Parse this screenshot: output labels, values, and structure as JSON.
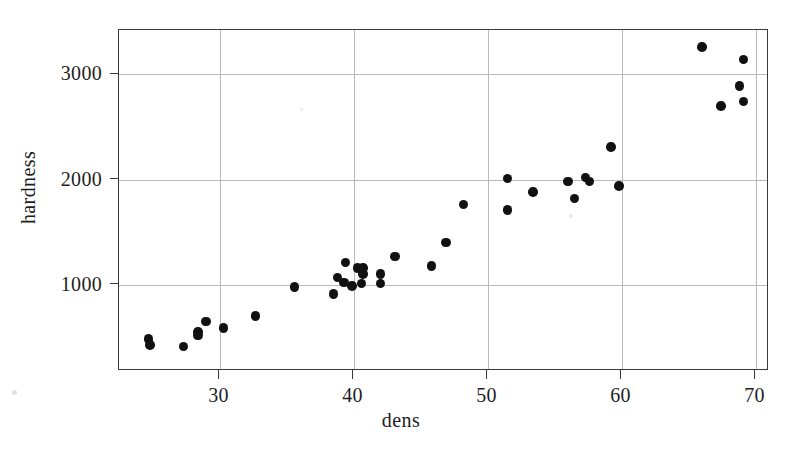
{
  "chart_data": {
    "type": "scatter",
    "title": "",
    "xlabel": "dens",
    "ylabel": "hardness",
    "xlim": [
      22.5,
      71.0
    ],
    "ylim": [
      180,
      3420
    ],
    "grid": true,
    "legend": "none",
    "marker": "filled-circle",
    "marker_color": "#111111",
    "xticks": [
      30,
      40,
      50,
      60,
      70
    ],
    "xticklabels": [
      "30",
      "40",
      "50",
      "60",
      "70"
    ],
    "yticks": [
      1000,
      2000,
      3000
    ],
    "yticklabels": [
      "1000",
      "2000",
      "3000"
    ],
    "x": [
      24.7,
      24.8,
      27.3,
      28.4,
      28.4,
      29.0,
      30.3,
      32.7,
      35.6,
      38.5,
      38.8,
      39.3,
      39.4,
      39.9,
      40.3,
      40.6,
      40.7,
      40.7,
      42.0,
      42.0,
      43.1,
      45.8,
      46.9,
      48.2,
      51.5,
      51.5,
      53.4,
      56.0,
      56.5,
      57.3,
      57.6,
      59.2,
      59.8,
      66.0,
      67.4,
      68.8,
      69.1,
      69.1
    ],
    "y": [
      484,
      427,
      413,
      517,
      549,
      648,
      587,
      704,
      979,
      914,
      1070,
      1020,
      1210,
      989,
      1160,
      1010,
      1100,
      1160,
      1010,
      1100,
      1270,
      1180,
      1400,
      1760,
      1710,
      2010,
      1880,
      1980,
      1820,
      2020,
      1980,
      2310,
      1940,
      3260,
      2700,
      2890,
      2740,
      3140
    ],
    "points": [
      {
        "dens": 24.7,
        "hardness": 484
      },
      {
        "dens": 24.8,
        "hardness": 427
      },
      {
        "dens": 27.3,
        "hardness": 413
      },
      {
        "dens": 28.4,
        "hardness": 517
      },
      {
        "dens": 28.4,
        "hardness": 549
      },
      {
        "dens": 29.0,
        "hardness": 648
      },
      {
        "dens": 30.3,
        "hardness": 587
      },
      {
        "dens": 32.7,
        "hardness": 704
      },
      {
        "dens": 35.6,
        "hardness": 979
      },
      {
        "dens": 38.5,
        "hardness": 914
      },
      {
        "dens": 38.8,
        "hardness": 1070
      },
      {
        "dens": 39.3,
        "hardness": 1020
      },
      {
        "dens": 39.4,
        "hardness": 1210
      },
      {
        "dens": 39.9,
        "hardness": 989
      },
      {
        "dens": 40.3,
        "hardness": 1160
      },
      {
        "dens": 40.6,
        "hardness": 1010
      },
      {
        "dens": 40.7,
        "hardness": 1100
      },
      {
        "dens": 40.7,
        "hardness": 1160
      },
      {
        "dens": 42.0,
        "hardness": 1010
      },
      {
        "dens": 42.0,
        "hardness": 1100
      },
      {
        "dens": 43.1,
        "hardness": 1270
      },
      {
        "dens": 45.8,
        "hardness": 1180
      },
      {
        "dens": 46.9,
        "hardness": 1400
      },
      {
        "dens": 48.2,
        "hardness": 1760
      },
      {
        "dens": 51.5,
        "hardness": 1710
      },
      {
        "dens": 51.5,
        "hardness": 2010
      },
      {
        "dens": 53.4,
        "hardness": 1880
      },
      {
        "dens": 56.0,
        "hardness": 1980
      },
      {
        "dens": 56.5,
        "hardness": 1820
      },
      {
        "dens": 57.3,
        "hardness": 2020
      },
      {
        "dens": 57.6,
        "hardness": 1980
      },
      {
        "dens": 59.2,
        "hardness": 2310
      },
      {
        "dens": 59.8,
        "hardness": 1940
      },
      {
        "dens": 66.0,
        "hardness": 3260
      },
      {
        "dens": 67.4,
        "hardness": 2700
      },
      {
        "dens": 68.8,
        "hardness": 2890
      },
      {
        "dens": 69.1,
        "hardness": 2740
      },
      {
        "dens": 69.1,
        "hardness": 3140
      }
    ]
  },
  "axes": {
    "ylabel": "hardness",
    "xlabel": "dens",
    "yticklabels": [
      "3000",
      "2000",
      "1000"
    ],
    "xticklabels": [
      "30",
      "40",
      "50",
      "60",
      "70"
    ]
  },
  "colors": {
    "marker": "#111111",
    "frame": "#3a3a3a",
    "grid": "#b9b9b9",
    "background": "#ffffff",
    "text": "#1e1e1e"
  }
}
